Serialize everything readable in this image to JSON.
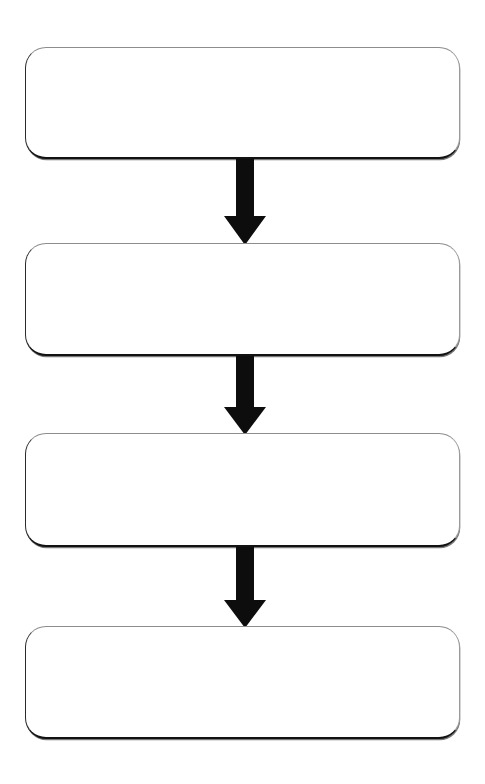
{
  "diagram": {
    "type": "flowchart",
    "orientation": "vertical",
    "title": "",
    "background_color": "#ffffff",
    "canvas": {
      "width": 485,
      "height": 784
    },
    "node_style": {
      "shape": "rounded-rectangle",
      "fill_color": "#ffffff",
      "border_color_light": "#8d8d8d",
      "border_color_dark": "#121212",
      "corner_radius": 21
    },
    "arrow_style": {
      "color": "#0d0d0d",
      "shaft_width": 18,
      "head_width": 42,
      "head_height": 28,
      "direction": "down"
    },
    "nodes": [
      {
        "id": "node-1",
        "label": "",
        "x": 25,
        "y": 47,
        "width": 435,
        "height": 112
      },
      {
        "id": "node-2",
        "label": "",
        "x": 25,
        "y": 243,
        "width": 435,
        "height": 113
      },
      {
        "id": "node-3",
        "label": "",
        "x": 25,
        "y": 433,
        "width": 435,
        "height": 114
      },
      {
        "id": "node-4",
        "label": "",
        "x": 25,
        "y": 626,
        "width": 435,
        "height": 113
      }
    ],
    "connectors": [
      {
        "id": "arrow-1",
        "from": "node-1",
        "to": "node-2",
        "label": "",
        "x": 224,
        "y": 159,
        "width": 42,
        "height": 86
      },
      {
        "id": "arrow-2",
        "from": "node-2",
        "to": "node-3",
        "label": "",
        "x": 224,
        "y": 356,
        "width": 42,
        "height": 79
      },
      {
        "id": "arrow-3",
        "from": "node-3",
        "to": "node-4",
        "label": "",
        "x": 224,
        "y": 547,
        "width": 42,
        "height": 81
      }
    ]
  }
}
